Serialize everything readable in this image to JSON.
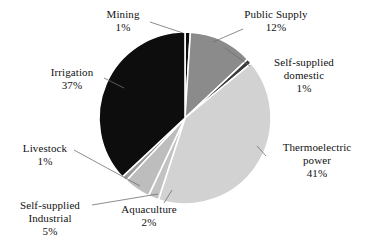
{
  "chart_data": {
    "type": "pie",
    "title": "",
    "subtitle": "",
    "xlabel": "",
    "ylabel": "",
    "legend_position": "none",
    "grid": false,
    "units": "percent",
    "categories": [
      "Mining",
      "Public Supply",
      "Self-supplied domestic",
      "Thermoelectric power",
      "Aquaculture",
      "Self-supplied Industrial",
      "Livestock",
      "Irrigation"
    ],
    "values": [
      1,
      12,
      1,
      41,
      2,
      5,
      1,
      37
    ],
    "slices": [
      {
        "name": "Mining",
        "label_line1": "Mining",
        "label_line2": "",
        "value": 1,
        "value_text": "1%",
        "color": "#0d0d0d",
        "start_deg": 0,
        "end_deg": 3.6
      },
      {
        "name": "Public Supply",
        "label_line1": "Public Supply",
        "label_line2": "",
        "value": 12,
        "value_text": "12%",
        "color": "#8b8b8b",
        "start_deg": 3.6,
        "end_deg": 46.8
      },
      {
        "name": "Self-supplied domestic",
        "label_line1": "Self-supplied",
        "label_line2": "domestic",
        "value": 1,
        "value_text": "1%",
        "color": "#3a3a3a",
        "start_deg": 46.8,
        "end_deg": 50.4
      },
      {
        "name": "Thermoelectric power",
        "label_line1": "Thermoelectric",
        "label_line2": "power",
        "value": 41,
        "value_text": "41%",
        "color": "#d2d2d2",
        "start_deg": 50.4,
        "end_deg": 198.0
      },
      {
        "name": "Aquaculture",
        "label_line1": "Aquaculture",
        "label_line2": "",
        "value": 2,
        "value_text": "2%",
        "color": "#c2c2c2",
        "start_deg": 198.0,
        "end_deg": 205.2
      },
      {
        "name": "Self-supplied Industrial",
        "label_line1": "Self-supplied",
        "label_line2": "Industrial",
        "value": 5,
        "value_text": "5%",
        "color": "#bdbdbd",
        "start_deg": 205.2,
        "end_deg": 223.2
      },
      {
        "name": "Livestock",
        "label_line1": "Livestock",
        "label_line2": "",
        "value": 1,
        "value_text": "1%",
        "color": "#9a9a9a",
        "start_deg": 223.2,
        "end_deg": 226.8
      },
      {
        "name": "Irrigation",
        "label_line1": "Irrigation",
        "label_line2": "",
        "value": 37,
        "value_text": "37%",
        "color": "#0d0d0d",
        "start_deg": 226.8,
        "end_deg": 360.0
      }
    ],
    "geometry": {
      "center_x": 185,
      "center_y": 118,
      "radius": 86
    },
    "colors": {
      "background": "#ffffff",
      "text": "#111111",
      "leader_line": "#6f6f6f",
      "slice_separator": "#ffffff"
    }
  }
}
